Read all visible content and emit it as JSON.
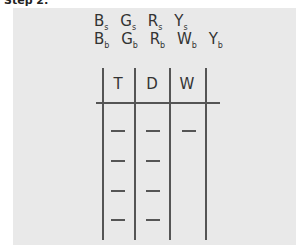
{
  "heading": "Step 2:",
  "rows": {
    "small": [
      {
        "letter": "B",
        "sub": "s"
      },
      {
        "letter": "G",
        "sub": "s"
      },
      {
        "letter": "R",
        "sub": "s"
      },
      {
        "letter": "Y",
        "sub": "s"
      }
    ],
    "big": [
      {
        "letter": "B",
        "sub": "b"
      },
      {
        "letter": "G",
        "sub": "b"
      },
      {
        "letter": "R",
        "sub": "b"
      },
      {
        "letter": "W",
        "sub": "b"
      },
      {
        "letter": "Y",
        "sub": "b"
      }
    ]
  },
  "table": {
    "columns": [
      "T",
      "D",
      "W"
    ],
    "blanks": [
      [
        "—",
        "—",
        "—"
      ],
      [
        "—",
        "—",
        ""
      ],
      [
        "—",
        "—",
        ""
      ],
      [
        "—",
        "—",
        ""
      ]
    ]
  }
}
